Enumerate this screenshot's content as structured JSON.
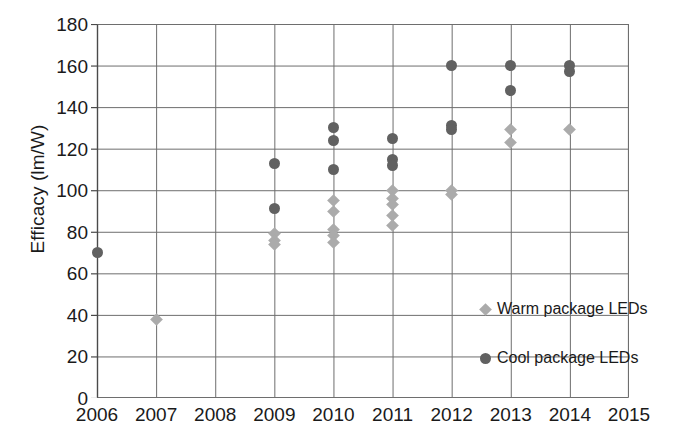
{
  "chart_data": {
    "type": "scatter",
    "title": "",
    "xlabel": "",
    "ylabel": "Efficacy (lm/W)",
    "xlim": [
      2006,
      2015
    ],
    "ylim": [
      0,
      180
    ],
    "xticks": [
      "2006",
      "2007",
      "2008",
      "2009",
      "2010",
      "2011",
      "2012",
      "2013",
      "2014",
      "2015"
    ],
    "yticks": [
      "0",
      "20",
      "40",
      "60",
      "80",
      "100",
      "120",
      "140",
      "160",
      "180"
    ],
    "grid": true,
    "legend_position": "inside-center-right",
    "series": [
      {
        "name": "Warm package LEDs",
        "marker": "diamond",
        "color": "#ababab",
        "points": [
          {
            "x": 2007,
            "y": 38
          },
          {
            "x": 2009,
            "y": 79
          },
          {
            "x": 2009,
            "y": 76
          },
          {
            "x": 2009,
            "y": 74
          },
          {
            "x": 2010,
            "y": 95
          },
          {
            "x": 2010,
            "y": 90
          },
          {
            "x": 2010,
            "y": 81
          },
          {
            "x": 2010,
            "y": 78
          },
          {
            "x": 2010,
            "y": 75
          },
          {
            "x": 2011,
            "y": 100
          },
          {
            "x": 2011,
            "y": 96
          },
          {
            "x": 2011,
            "y": 93
          },
          {
            "x": 2011,
            "y": 88
          },
          {
            "x": 2011,
            "y": 83
          },
          {
            "x": 2012,
            "y": 100
          },
          {
            "x": 2012,
            "y": 98
          },
          {
            "x": 2013,
            "y": 129
          },
          {
            "x": 2013,
            "y": 123
          },
          {
            "x": 2014,
            "y": 129
          }
        ]
      },
      {
        "name": "Cool package LEDs",
        "marker": "circle",
        "color": "#616161",
        "points": [
          {
            "x": 2006,
            "y": 70
          },
          {
            "x": 2009,
            "y": 113
          },
          {
            "x": 2009,
            "y": 91
          },
          {
            "x": 2010,
            "y": 130
          },
          {
            "x": 2010,
            "y": 124
          },
          {
            "x": 2010,
            "y": 110
          },
          {
            "x": 2011,
            "y": 125
          },
          {
            "x": 2011,
            "y": 115
          },
          {
            "x": 2011,
            "y": 112
          },
          {
            "x": 2012,
            "y": 160
          },
          {
            "x": 2012,
            "y": 131
          },
          {
            "x": 2012,
            "y": 129
          },
          {
            "x": 2013,
            "y": 160
          },
          {
            "x": 2013,
            "y": 148
          },
          {
            "x": 2014,
            "y": 160
          },
          {
            "x": 2014,
            "y": 157
          }
        ]
      }
    ]
  },
  "legend": {
    "items": [
      {
        "label": "Warm package LEDs",
        "marker": "warm-diamond-marker"
      },
      {
        "label": "Cool package LEDs",
        "marker": "cool-circle-marker"
      }
    ]
  },
  "colors": {
    "warm": "#ababab",
    "cool": "#616161",
    "grid": "#6e6e6e",
    "axis": "#4a4a4a",
    "text": "#1a1a1a",
    "background": "#ffffff"
  }
}
